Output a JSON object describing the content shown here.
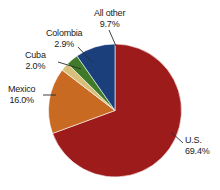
{
  "chart_data": {
    "type": "pie",
    "title": "",
    "subtitle": "",
    "xlabel": "",
    "ylabel": "",
    "legend_position": "none",
    "grid": false,
    "units": "percent",
    "start_angle_deg": 0,
    "direction": "clockwise",
    "categories": [
      "U.S.",
      "Mexico",
      "Cuba",
      "Colombia",
      "All other"
    ],
    "values": [
      69.4,
      16.0,
      2.0,
      2.9,
      9.7
    ],
    "colors": [
      "#9E1B1B",
      "#C96A22",
      "#D9C07A",
      "#3F7A28",
      "#1B3F7A"
    ],
    "slices": [
      {
        "name": "U.S.",
        "value": 69.4,
        "label": "U.S.",
        "value_label": "69.4%",
        "color": "#9E1B1B"
      },
      {
        "name": "Mexico",
        "value": 16.0,
        "label": "Mexico",
        "value_label": "16.0%",
        "color": "#C96A22"
      },
      {
        "name": "Cuba",
        "value": 2.0,
        "label": "Cuba",
        "value_label": "2.0%",
        "color": "#D9C07A"
      },
      {
        "name": "Colombia",
        "value": 2.9,
        "label": "Colombia",
        "value_label": "2.9%",
        "color": "#3F7A28"
      },
      {
        "name": "All other",
        "value": 9.7,
        "label": "All other",
        "value_label": "9.7%",
        "color": "#1B3F7A"
      }
    ]
  },
  "labels": {
    "us": {
      "name": "U.S.",
      "value": "69.4%"
    },
    "mexico": {
      "name": "Mexico",
      "value": "16.0%"
    },
    "cuba": {
      "name": "Cuba",
      "value": "2.0%"
    },
    "colombia": {
      "name": "Colombia",
      "value": "2.9%"
    },
    "allother": {
      "name": "All other",
      "value": "9.7%"
    }
  },
  "style": {
    "background": "#ffffff",
    "text_color": "#1a1a1a",
    "leader_line_color": "#2b2b2b"
  }
}
